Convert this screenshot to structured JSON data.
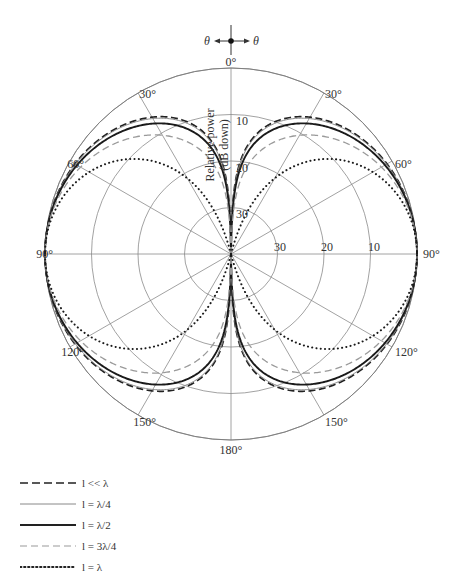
{
  "chart_data": {
    "type": "polar",
    "title": "",
    "radial_axis": {
      "label_line1": "Relative power",
      "label_line2": "(dB down)",
      "ticks": [
        "10",
        "20",
        "30"
      ],
      "range_db": [
        0,
        40
      ],
      "db_per_ring": 10
    },
    "angular_axis": {
      "tick_labels_right": [
        "0°",
        "30°",
        "60°",
        "90°",
        "120°",
        "150°",
        "180°"
      ],
      "tick_labels_left": [
        "30°",
        "60°",
        "90°",
        "120°",
        "150°"
      ],
      "spoke_step_deg": 30
    },
    "theta_indicator": {
      "left": "θ",
      "right": "θ"
    },
    "grid": true,
    "series": [
      {
        "name": "l << λ",
        "kl_half": 0,
        "style": "dashed-dark",
        "values_db": {
          "10": -30.3,
          "20": -20.7,
          "30": -12.0,
          "45": -6.0,
          "60": -2.5,
          "75": -0.6,
          "90": 0
        }
      },
      {
        "name": "l = λ/4",
        "kl_half": 0.7854,
        "style": "solid-thin-gray",
        "values_db": {
          "10": -31.8,
          "20": -22.0,
          "30": -13.1,
          "45": -6.8,
          "60": -2.9,
          "75": -0.7,
          "90": 0
        }
      },
      {
        "name": "l = λ/2",
        "kl_half": 1.5708,
        "style": "solid-thick",
        "values_db": {
          "10": -35.5,
          "20": -24.8,
          "30": -15.2,
          "45": -8.3,
          "60": -3.8,
          "75": -1.0,
          "90": 0
        }
      },
      {
        "name": "l = 3λ/4",
        "kl_half": 2.3562,
        "style": "dashed-light-gray",
        "values_db": {
          "10": -41.0,
          "20": -29.5,
          "30": -19.6,
          "45": -11.3,
          "60": -5.3,
          "75": -1.5,
          "90": 0
        }
      },
      {
        "name": "l = λ",
        "kl_half": 3.1416,
        "style": "dotted",
        "values_db": {
          "10": -50.0,
          "20": -38.0,
          "30": -26.5,
          "45": -15.2,
          "60": -7.6,
          "75": -2.2,
          "90": 0
        }
      }
    ]
  },
  "legend": {
    "items": [
      {
        "label": "l << λ"
      },
      {
        "label": "l = λ/4"
      },
      {
        "label": "l = λ/2"
      },
      {
        "label": "l = 3λ/4"
      },
      {
        "label": "l = λ"
      }
    ]
  }
}
